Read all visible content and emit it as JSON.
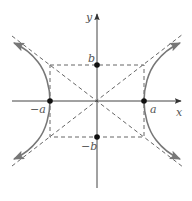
{
  "diagram": {
    "type": "hyperbola",
    "equation": "x^2/a^2 - y^2/b^2 = 1",
    "origin_px": [
      97,
      101
    ],
    "a_px": 47,
    "b_px": 36,
    "colors": {
      "axis": "#444444",
      "curve": "#777777",
      "dashed": "#555555",
      "point": "#111111",
      "label": "#555555"
    },
    "axes": {
      "x_label": "x",
      "y_label": "y"
    },
    "labels": {
      "a_pos": "a",
      "a_neg": "−a",
      "b_pos": "b",
      "b_neg": "−b"
    },
    "points": [
      {
        "name": "vertex-right",
        "label": "a"
      },
      {
        "name": "vertex-left",
        "label": "−a"
      },
      {
        "name": "co-vertex-top",
        "label": "b"
      },
      {
        "name": "co-vertex-bottom",
        "label": "−b"
      }
    ],
    "elements": {
      "fundamental_rectangle": "dashed",
      "asymptotes": "dashed, slopes ±b/a",
      "branches": "two branches opening left and right with arrows"
    }
  }
}
